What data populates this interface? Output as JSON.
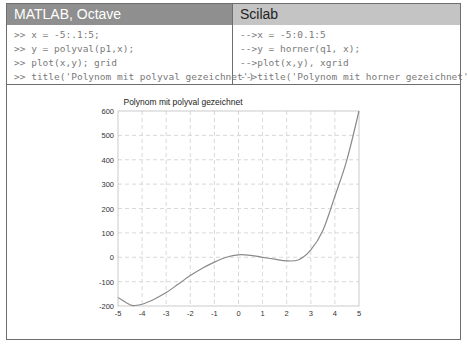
{
  "table": {
    "headers": [
      {
        "label": "MATLAB, Octave"
      },
      {
        "label": "Scilab"
      }
    ],
    "code": {
      "matlab": [
        ">> x = -5:.1:5;",
        ">> y = polyval(p1,x);",
        ">> plot(x,y); grid",
        ">> title('Polynom mit polyval gezeichnet')"
      ],
      "scilab": [
        "-->x = -5:0.1:5",
        "-->y = horner(q1, x);",
        "-->plot(x,y), xgrid",
        "-->title('Polynom mit horner gezeichnet')"
      ]
    }
  },
  "colors": {
    "header_left_bg": "#8f8f8f",
    "header_right_bg": "#c4c4c4",
    "border": "#6e6e6e",
    "code_text": "#7a7a7a",
    "curve": "#8a8a8a",
    "grid": "#cfcfcf"
  },
  "chart_data": {
    "type": "line",
    "title": "Polynom mit polyval gezeichnet",
    "xlabel": "",
    "ylabel": "",
    "xlim": [
      -5,
      5
    ],
    "ylim": [
      -200,
      600
    ],
    "xticks": [
      "-5",
      "-4",
      "-3",
      "-2",
      "-1",
      "0",
      "1",
      "2",
      "3",
      "4",
      "5"
    ],
    "yticks": [
      "600",
      "500",
      "400",
      "300",
      "200",
      "100",
      "0",
      "-100",
      "-200"
    ],
    "grid": true,
    "series": [
      {
        "name": "y",
        "x": [
          -5,
          -4.5,
          -4.3,
          -4,
          -3.5,
          -3,
          -2.5,
          -2,
          -1.5,
          -1,
          -0.5,
          0,
          0.5,
          1,
          1.5,
          2,
          2.5,
          3,
          3.5,
          4,
          4.5,
          5
        ],
        "y": [
          -165,
          -195,
          -198,
          -193,
          -172,
          -145,
          -110,
          -75,
          -45,
          -20,
          0,
          10,
          8,
          0,
          -8,
          -15,
          -10,
          30,
          110,
          250,
          400,
          600
        ]
      }
    ]
  }
}
